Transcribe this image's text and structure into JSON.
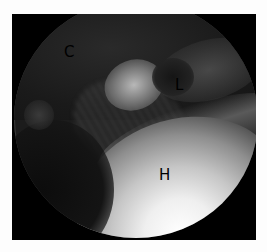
{
  "image": {
    "type": "arthroscopic-view",
    "background_color": "#000000",
    "labels": [
      {
        "id": "c",
        "text": "C"
      },
      {
        "id": "l",
        "text": "L"
      },
      {
        "id": "h",
        "text": "H"
      }
    ]
  }
}
